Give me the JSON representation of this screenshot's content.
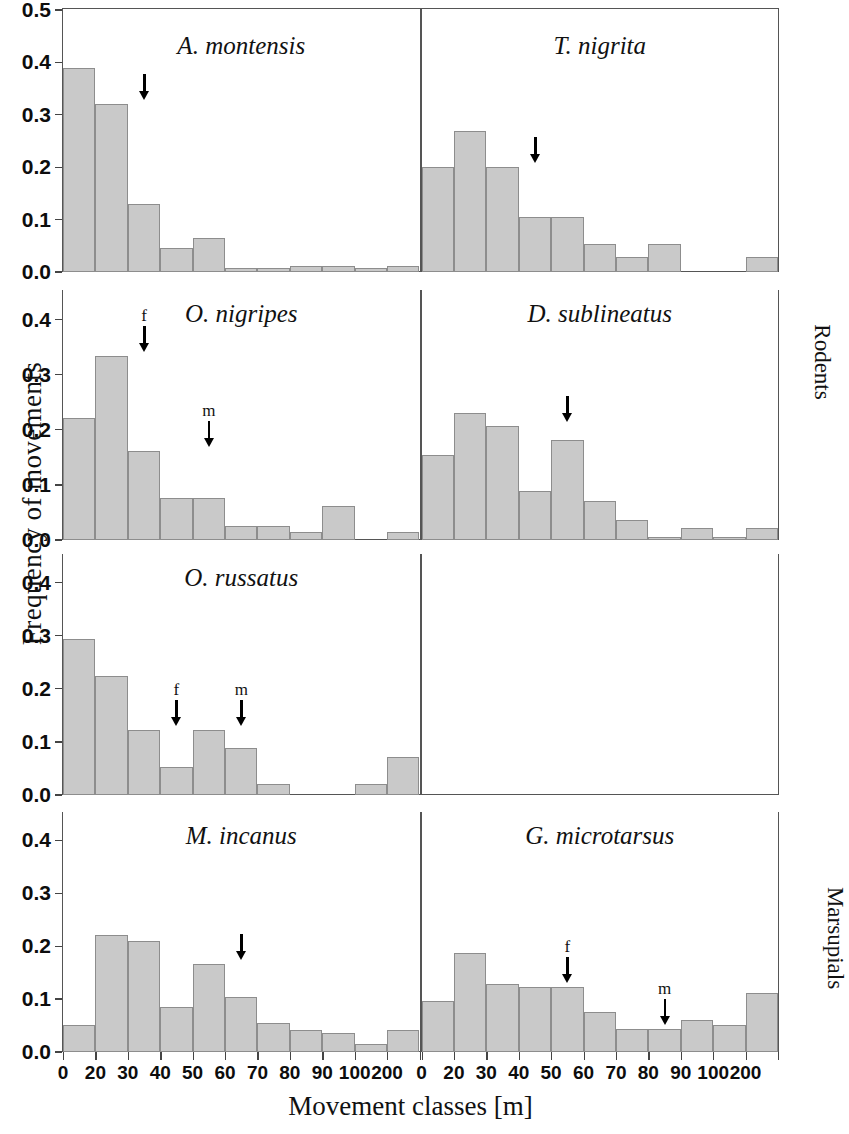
{
  "figure": {
    "ylabel": "Frequency of movements",
    "xlabel": "Movement classes [m]",
    "group_rodents": "Rodents",
    "group_marsupials": "Marsupials",
    "bar_color": "#c9c9c9",
    "bar_edge_color": "#8d8d8d",
    "axis_color": "#555555"
  },
  "axes": {
    "x_tick_labels": [
      "0",
      "20",
      "30",
      "40",
      "50",
      "60",
      "70",
      "80",
      "90",
      "100",
      "200"
    ],
    "y_tick_labels_full": [
      "0.0",
      "0.1",
      "0.2",
      "0.3",
      "0.4",
      "0.5"
    ],
    "y_tick_labels_short": [
      "0.0",
      "0.1",
      "0.2",
      "0.3",
      "0.4"
    ]
  },
  "chart_data": {
    "type": "bar",
    "xlabel": "Movement classes [m]",
    "ylabel": "Frequency of movements",
    "grid": false,
    "legend": "none",
    "categories": [
      "0-10",
      "10-20",
      "20-30",
      "30-40",
      "40-50",
      "50-60",
      "60-70",
      "70-80",
      "80-90",
      "90-100",
      "100-200"
    ],
    "x_tick_labels": [
      "0",
      "20",
      "30",
      "40",
      "50",
      "60",
      "70",
      "80",
      "90",
      "100",
      "200"
    ],
    "panels": [
      {
        "id": "a-montensis",
        "species": "A. montensis",
        "group": "Rodents",
        "row": 1,
        "col": 1,
        "ylim": [
          0.0,
          0.5
        ],
        "yticks": [
          0.0,
          0.1,
          0.2,
          0.3,
          0.4,
          0.5
        ],
        "values": [
          0.39,
          0.32,
          0.13,
          0.045,
          0.065,
          0.008,
          0.008,
          0.012,
          0.012,
          0.008,
          0.012
        ],
        "arrows": [
          {
            "label": "",
            "bin_index": 2,
            "value": 0.32
          }
        ]
      },
      {
        "id": "t-nigrita",
        "species": "T. nigrita",
        "group": "Rodents",
        "row": 1,
        "col": 2,
        "ylim": [
          0.0,
          0.5
        ],
        "yticks": [
          0.0,
          0.1,
          0.2,
          0.3,
          0.4,
          0.5
        ],
        "values": [
          0.2,
          0.27,
          0.2,
          0.105,
          0.105,
          0.053,
          0.029,
          0.053,
          0.0,
          0.0,
          0.028
        ],
        "arrows": [
          {
            "label": "",
            "bin_index": 3,
            "value": 0.2
          }
        ]
      },
      {
        "id": "o-nigripes",
        "species": "O. nigripes",
        "group": "Rodents",
        "row": 2,
        "col": 1,
        "ylim": [
          0.0,
          0.45
        ],
        "yticks": [
          0.0,
          0.1,
          0.2,
          0.3,
          0.4
        ],
        "values": [
          0.222,
          0.334,
          0.162,
          0.076,
          0.076,
          0.025,
          0.025,
          0.014,
          0.062,
          0.0,
          0.014
        ],
        "arrows": [
          {
            "label": "f",
            "bin_index": 2,
            "value": 0.334
          },
          {
            "label": "m",
            "bin_index": 4,
            "value": 0.162
          }
        ]
      },
      {
        "id": "d-sublineatus",
        "species": "D. sublineatus",
        "group": "Rodents",
        "row": 2,
        "col": 2,
        "ylim": [
          0.0,
          0.45
        ],
        "yticks": [
          0.0,
          0.1,
          0.2,
          0.3,
          0.4
        ],
        "values": [
          0.155,
          0.23,
          0.207,
          0.089,
          0.182,
          0.07,
          0.037,
          0.006,
          0.022,
          0.006,
          0.021
        ],
        "arrows": [
          {
            "label": "",
            "bin_index": 4,
            "value": 0.207
          }
        ]
      },
      {
        "id": "o-russatus",
        "species": "O. russatus",
        "group": "Rodents",
        "row": 3,
        "col": 1,
        "ylim": [
          0.0,
          0.45
        ],
        "yticks": [
          0.0,
          0.1,
          0.2,
          0.3,
          0.4
        ],
        "values": [
          0.294,
          0.225,
          0.122,
          0.053,
          0.122,
          0.088,
          0.02,
          0.0,
          0.0,
          0.021,
          0.071
        ],
        "arrows": [
          {
            "label": "f",
            "bin_index": 3,
            "value": 0.122
          },
          {
            "label": "m",
            "bin_index": 5,
            "value": 0.122
          }
        ]
      },
      {
        "id": "empty-panel",
        "species": "",
        "group": "Rodents",
        "row": 3,
        "col": 2,
        "ylim": [
          0.0,
          0.45
        ],
        "yticks": [],
        "values": [],
        "arrows": []
      },
      {
        "id": "m-incanus",
        "species": "M. incanus",
        "group": "Marsupials",
        "row": 4,
        "col": 1,
        "ylim": [
          0.0,
          0.45
        ],
        "yticks": [
          0.0,
          0.1,
          0.2,
          0.3,
          0.4
        ],
        "values": [
          0.052,
          0.222,
          0.21,
          0.086,
          0.166,
          0.104,
          0.054,
          0.042,
          0.036,
          0.016,
          0.042
        ],
        "arrows": [
          {
            "label": "",
            "bin_index": 5,
            "value": 0.166
          }
        ]
      },
      {
        "id": "g-microtarsus",
        "species": "G. microtarsus",
        "group": "Marsupials",
        "row": 4,
        "col": 2,
        "ylim": [
          0.0,
          0.45
        ],
        "yticks": [
          0.0,
          0.1,
          0.2,
          0.3,
          0.4
        ],
        "values": [
          0.096,
          0.188,
          0.128,
          0.122,
          0.122,
          0.076,
          0.043,
          0.043,
          0.06,
          0.052,
          0.112
        ],
        "arrows": [
          {
            "label": "f",
            "bin_index": 4,
            "value": 0.122
          },
          {
            "label": "m",
            "bin_index": 7,
            "value": 0.043
          }
        ]
      }
    ]
  }
}
